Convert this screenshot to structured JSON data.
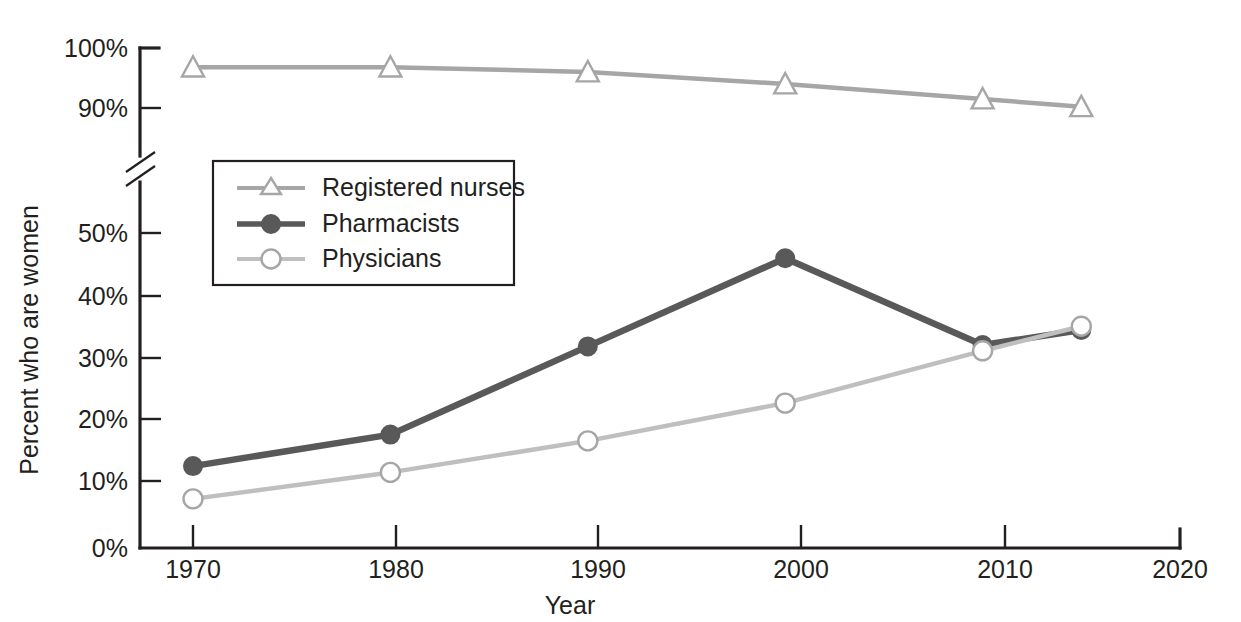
{
  "chart_data": {
    "type": "line",
    "title": "",
    "xlabel": "Year",
    "ylabel": "Percent who are women",
    "x": [
      1970,
      1980,
      1990,
      2000,
      2010,
      2015
    ],
    "xlim": [
      1966,
      2020
    ],
    "xticks": [
      1970,
      1980,
      1990,
      2000,
      2010,
      2020
    ],
    "xtick_labels": [
      "1970",
      "1980",
      "1990",
      "2000",
      "2010",
      "2020"
    ],
    "yticks": [
      0,
      10,
      20,
      30,
      40,
      50,
      90,
      100
    ],
    "ytick_labels": [
      "0%",
      "10%",
      "20%",
      "30%",
      "40%",
      "50%",
      "90%",
      "100%"
    ],
    "y_axis_break": true,
    "y_axis_break_between": [
      50,
      90
    ],
    "grid": false,
    "legend_position": "upper-left-inside",
    "series": [
      {
        "name": "Registered nurses",
        "marker": "open-triangle",
        "color": "#a6a6a6",
        "values": [
          96.8,
          96.8,
          96.0,
          94.0,
          91.5,
          90.2
        ]
      },
      {
        "name": "Pharmacists",
        "marker": "filled-circle",
        "color": "#595959",
        "values": [
          13.0,
          18.0,
          32.0,
          46.0,
          50.5,
          53.0
        ]
      },
      {
        "name": "Physicians",
        "marker": "open-circle",
        "color": "#bfbfbf",
        "values": [
          7.8,
          12.0,
          17.0,
          23.0,
          31.3,
          35.2
        ]
      }
    ]
  },
  "legend": {
    "items": [
      {
        "label": "Registered nurses"
      },
      {
        "label": "Pharmacists"
      },
      {
        "label": "Physicians"
      }
    ]
  },
  "axes": {
    "y_title": "Percent who are women",
    "x_title": "Year",
    "y_labels": [
      "100%",
      "90%",
      "50%",
      "40%",
      "30%",
      "20%",
      "10%",
      "0%"
    ],
    "x_labels": [
      "1970",
      "1980",
      "1990",
      "2000",
      "2010",
      "2020"
    ]
  },
  "colors": {
    "nurses": "#a6a6a6",
    "pharmacists": "#595959",
    "physicians": "#bfbfbf",
    "axis": "#231f20",
    "background": "#ffffff"
  }
}
